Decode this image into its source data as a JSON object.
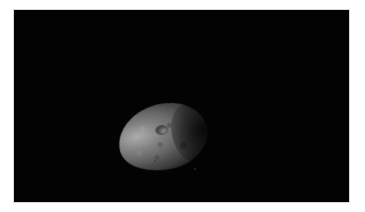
{
  "image": {
    "subject": "asteroid",
    "description": "Irregular, elongated grey rocky body lit from the upper left against a black background, with a small visible crater near its center-top",
    "colors": {
      "page_background": "#ffffff",
      "frame_background": "#030303",
      "highlight": "#afafaf",
      "midtone": "#5a5a5a",
      "shadow": "#1e1e1e"
    },
    "features": [
      {
        "name": "crater",
        "position": "upper-center of asteroid"
      },
      {
        "name": "terminator-shadow",
        "position": "right side of asteroid"
      }
    ]
  }
}
